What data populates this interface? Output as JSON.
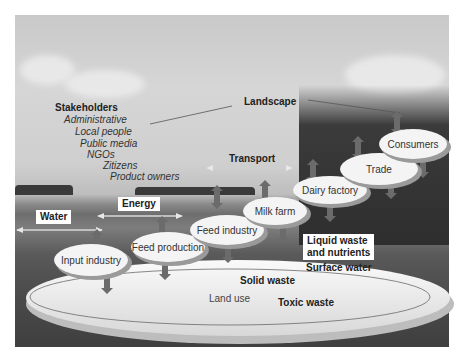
{
  "diagram": {
    "top_label": "Landscape",
    "stakeholders": {
      "title": "Stakeholders",
      "items": [
        "Administrative",
        "Local people",
        "Public media",
        "NGOs",
        "Zitizens",
        "Product owners"
      ]
    },
    "flows": {
      "transport": "Transport",
      "energy": "Energy",
      "water": "Water"
    },
    "chain_nodes": [
      {
        "id": "input-industry",
        "label": "Input industry"
      },
      {
        "id": "feed-production",
        "label": "Feed production"
      },
      {
        "id": "feed-industry",
        "label": "Feed industry"
      },
      {
        "id": "milk-farm",
        "label": "Milk farm"
      },
      {
        "id": "dairy-factory",
        "label": "Dairy factory"
      },
      {
        "id": "trade",
        "label": "Trade"
      },
      {
        "id": "consumers",
        "label": "Consumers"
      }
    ],
    "outputs": {
      "liquid_waste_line1": "Liquid waste",
      "liquid_waste_line2": "and nutrients",
      "surface_water": "Surface water",
      "solid_waste": "Solid waste",
      "land_use": "Land use",
      "toxic_waste": "Toxic waste"
    },
    "colors": {
      "arrow": "#6b6b6b",
      "ellipse_fill": "#f4f4f4",
      "ellipse_shadow": "#9a9a9a",
      "sky": "#cfcfcf",
      "ground": "#4a4a4a"
    }
  }
}
